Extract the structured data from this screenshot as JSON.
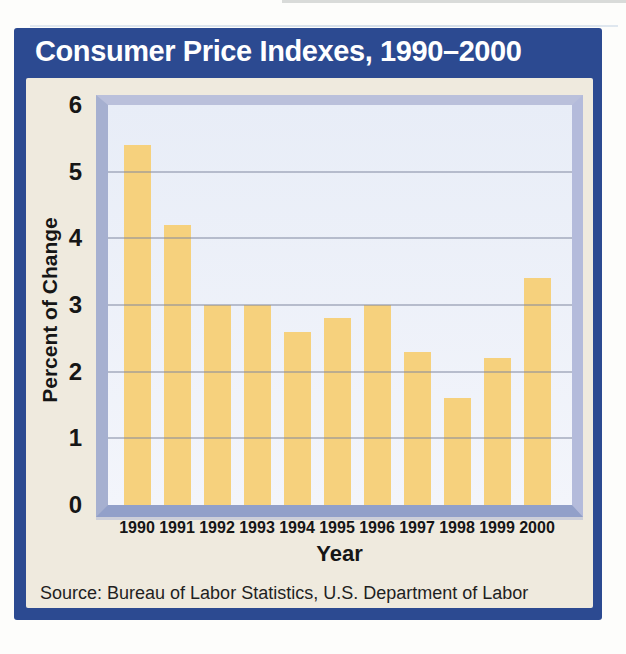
{
  "header": {
    "title": "Consumer Price Indexes, 1990–2000"
  },
  "chart_data": {
    "type": "bar",
    "title": "Consumer Price Indexes, 1990–2000",
    "categories": [
      "1990",
      "1991",
      "1992",
      "1993",
      "1994",
      "1995",
      "1996",
      "1997",
      "1998",
      "1999",
      "2000"
    ],
    "values": [
      5.4,
      4.2,
      3.0,
      3.0,
      2.6,
      2.8,
      3.0,
      2.3,
      1.6,
      2.2,
      3.4
    ],
    "xlabel": "Year",
    "ylabel": "Percent of Change",
    "ylim": [
      0,
      6
    ],
    "yticks": [
      0,
      1,
      2,
      3,
      4,
      5,
      6
    ],
    "grid": true,
    "legend": "none",
    "bar_color": "#f6d17d",
    "plot_bg": "#e8edf7",
    "frame_color": "#2c4a91"
  },
  "footer": {
    "source": "Source: Bureau of Labor Statistics, U.S. Department of Labor"
  },
  "colors": {
    "accent_blue": "#2c4a91",
    "panel_cream": "#efeade",
    "bar_gold": "#f6d17d",
    "bevel_gray_blue": "#a6b0d0",
    "title_text": "#ffffff",
    "body_text": "#161616"
  }
}
